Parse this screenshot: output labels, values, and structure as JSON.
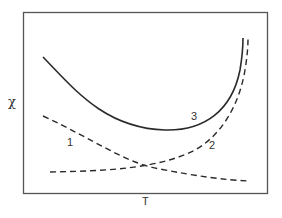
{
  "diagram": {
    "x_axis_label": "T",
    "y_axis_label": "χ",
    "curves": [
      {
        "id": "1",
        "label": "1",
        "style": "dashed",
        "description": "decreasing with T"
      },
      {
        "id": "2",
        "label": "2",
        "style": "dashed",
        "description": "increasing with T"
      },
      {
        "id": "3",
        "label": "3",
        "style": "solid",
        "description": "sum, U-shaped with minimum"
      }
    ],
    "colors": {
      "line": "#2a2a2a",
      "frame": "#555555",
      "background": "#ffffff"
    }
  }
}
